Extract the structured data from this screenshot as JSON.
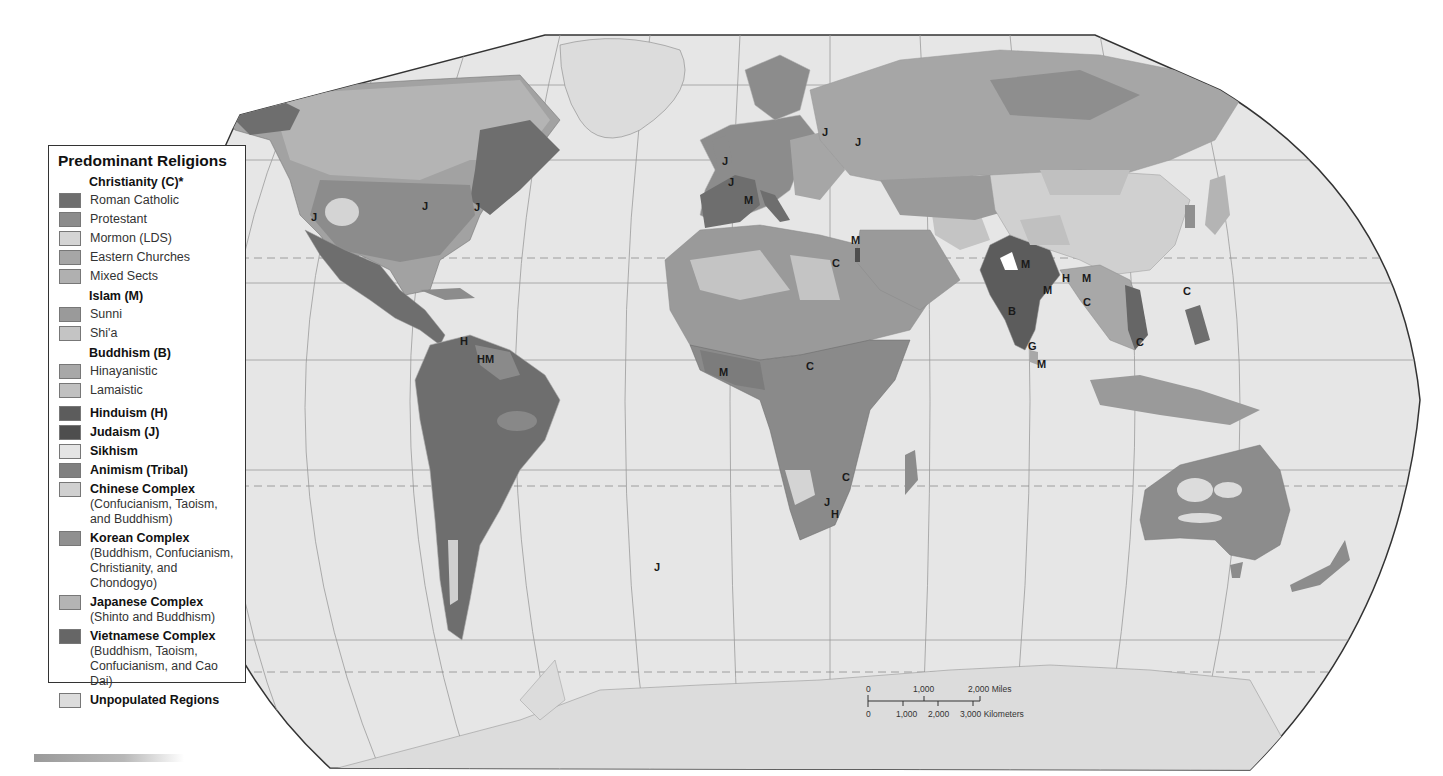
{
  "legend": {
    "title": "Predominant Religions",
    "groups": [
      {
        "heading": "Christianity (C)*",
        "items": [
          {
            "label": "Roman Catholic",
            "color": "#6e6e6e"
          },
          {
            "label": "Protestant",
            "color": "#8c8c8c"
          },
          {
            "label": "Mormon (LDS)",
            "color": "#d4d4d4"
          },
          {
            "label": "Eastern Churches",
            "color": "#a6a6a6"
          },
          {
            "label": "Mixed Sects",
            "color": "#b0b0b0"
          }
        ]
      },
      {
        "heading": "Islam (M)",
        "items": [
          {
            "label": "Sunni",
            "color": "#9a9a9a"
          },
          {
            "label": "Shi'a",
            "color": "#c4c4c4"
          }
        ]
      },
      {
        "heading": "Buddhism (B)",
        "items": [
          {
            "label": "Hinayanistic",
            "color": "#a8a8a8"
          },
          {
            "label": "Lamaistic",
            "color": "#c0c0c0"
          }
        ]
      }
    ],
    "single_items": [
      {
        "label": "Hinduism (H)",
        "color": "#5c5c5c"
      },
      {
        "label": "Judaism (J)",
        "color": "#4e4e4e"
      },
      {
        "label": "Sikhism",
        "color": "#e4e4e4"
      },
      {
        "label": "Animism (Tribal)",
        "color": "#808080"
      },
      {
        "label": "Chinese Complex",
        "sub": "(Confucianism, Taoism, and Buddhism)",
        "color": "#d0d0d0"
      },
      {
        "label": "Korean Complex",
        "sub": "(Buddhism, Confucianism, Christianity, and Chondogyo)",
        "color": "#909090"
      },
      {
        "label": "Japanese Complex",
        "sub": "(Shinto and Buddhism)",
        "color": "#b4b4b4"
      },
      {
        "label": "Vietnamese Complex",
        "sub": "(Buddhism, Taoism, Confucianism, and Cao Dai)",
        "color": "#666666"
      },
      {
        "label": "Unpopulated Regions",
        "color": "#dcdcdc"
      }
    ]
  },
  "map_labels": [
    {
      "text": "J",
      "x": 722,
      "y": 165
    },
    {
      "text": "J",
      "x": 728,
      "y": 186
    },
    {
      "text": "M",
      "x": 744,
      "y": 204
    },
    {
      "text": "J",
      "x": 822,
      "y": 136
    },
    {
      "text": "J",
      "x": 855,
      "y": 146
    },
    {
      "text": "M",
      "x": 851,
      "y": 244
    },
    {
      "text": "C",
      "x": 832,
      "y": 267
    },
    {
      "text": "J",
      "x": 311,
      "y": 221
    },
    {
      "text": "J",
      "x": 422,
      "y": 210
    },
    {
      "text": "J",
      "x": 474,
      "y": 211
    },
    {
      "text": "H",
      "x": 460,
      "y": 345
    },
    {
      "text": "HM",
      "x": 477,
      "y": 363
    },
    {
      "text": "M",
      "x": 719,
      "y": 376
    },
    {
      "text": "C",
      "x": 806,
      "y": 370
    },
    {
      "text": "C",
      "x": 842,
      "y": 481
    },
    {
      "text": "J",
      "x": 824,
      "y": 506
    },
    {
      "text": "H",
      "x": 831,
      "y": 518
    },
    {
      "text": "J",
      "x": 654,
      "y": 571
    },
    {
      "text": "M",
      "x": 1021,
      "y": 268
    },
    {
      "text": "M",
      "x": 1043,
      "y": 294
    },
    {
      "text": "H",
      "x": 1062,
      "y": 282
    },
    {
      "text": "M",
      "x": 1082,
      "y": 282
    },
    {
      "text": "B",
      "x": 1008,
      "y": 315
    },
    {
      "text": "C",
      "x": 1083,
      "y": 306
    },
    {
      "text": "G",
      "x": 1028,
      "y": 350
    },
    {
      "text": "M",
      "x": 1037,
      "y": 368
    },
    {
      "text": "C",
      "x": 1136,
      "y": 346
    },
    {
      "text": "C",
      "x": 1183,
      "y": 295
    }
  ],
  "scale_bar": {
    "miles_labels": [
      "0",
      "1,000",
      "2,000 Miles"
    ],
    "km_labels": [
      "0",
      "1,000",
      "2,000",
      "3,000 Kilometers"
    ]
  }
}
